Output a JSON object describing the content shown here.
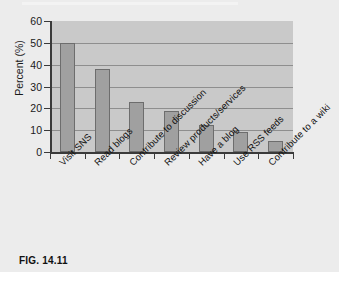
{
  "figure": {
    "caption": "FIG. 14.11"
  },
  "chart_data": {
    "type": "bar",
    "title": "",
    "xlabel": "",
    "ylabel": "Percent (%)",
    "ylim": [
      0,
      60
    ],
    "ytick_step": 10,
    "yticks": [
      "60",
      "50",
      "40",
      "30",
      "20",
      "10",
      "0"
    ],
    "grid": true,
    "legend": "none",
    "categories": [
      "Visit SNS",
      "Read blogs",
      "Contribute to discussion",
      "Review products/services",
      "Have a blog",
      "Use RSS feeds",
      "Contribute to a wiki"
    ],
    "values": [
      50,
      38,
      23,
      19,
      12.5,
      9,
      5
    ],
    "bar_color": "#a0a0a0",
    "bar_edge_color": "#6d6d6d",
    "plot_background": "#c9c9c9",
    "gridline_color": "#8e8e8e",
    "axis_color": "#3a3a3a",
    "figure_background": "#ececec"
  }
}
